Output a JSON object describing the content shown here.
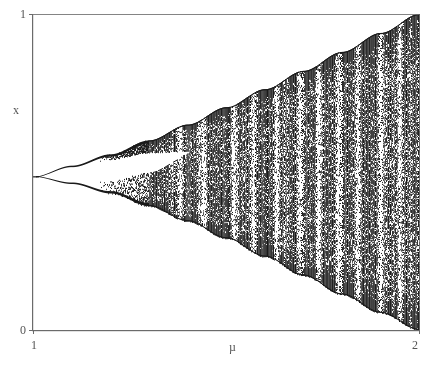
{
  "figure": {
    "background_color": "#ffffff",
    "ink_color": "#1a1a1a",
    "axis_color": "#6b6b6b",
    "label_color": "#555555"
  },
  "axes": {
    "y_axis_label": "x",
    "x_axis_label": "µ",
    "y_tick_top": "1",
    "y_tick_bottom": "0",
    "x_tick_left": "1",
    "x_tick_right": "2"
  },
  "chart_data": {
    "type": "scatter",
    "title": "",
    "subtitle": "",
    "xlabel": "µ",
    "ylabel": "x",
    "xlim": [
      1,
      2
    ],
    "ylim": [
      0,
      1
    ],
    "xticks": [
      1,
      2
    ],
    "xticklabels": [
      "1",
      "2"
    ],
    "yticks": [
      0,
      1
    ],
    "yticklabels": [
      "0",
      "1"
    ],
    "grid": false,
    "legend": null,
    "legend_position": "none",
    "plot_frame_px": {
      "left": 33,
      "right": 419,
      "top": 14,
      "bottom": 330
    },
    "features": {
      "bifurcation_origin": {
        "mu": 1.0,
        "x": 0.485
      },
      "upper_envelope": [
        {
          "mu": 1.0,
          "x": 0.485
        },
        {
          "mu": 1.1,
          "x": 0.52
        },
        {
          "mu": 1.2,
          "x": 0.556
        },
        {
          "mu": 1.3,
          "x": 0.6
        },
        {
          "mu": 1.4,
          "x": 0.65
        },
        {
          "mu": 1.5,
          "x": 0.705
        },
        {
          "mu": 1.6,
          "x": 0.762
        },
        {
          "mu": 1.7,
          "x": 0.82
        },
        {
          "mu": 1.8,
          "x": 0.88
        },
        {
          "mu": 1.9,
          "x": 0.94
        },
        {
          "mu": 2.0,
          "x": 1.0
        }
      ],
      "lower_envelope": [
        {
          "mu": 1.0,
          "x": 0.485
        },
        {
          "mu": 1.1,
          "x": 0.462
        },
        {
          "mu": 1.2,
          "x": 0.432
        },
        {
          "mu": 1.3,
          "x": 0.392
        },
        {
          "mu": 1.4,
          "x": 0.344
        },
        {
          "mu": 1.5,
          "x": 0.29
        },
        {
          "mu": 1.6,
          "x": 0.232
        },
        {
          "mu": 1.7,
          "x": 0.172
        },
        {
          "mu": 1.8,
          "x": 0.112
        },
        {
          "mu": 1.9,
          "x": 0.054
        },
        {
          "mu": 2.0,
          "x": 0.0
        }
      ],
      "period_two_gap": {
        "description": "White lens-shaped gap between the two period-2 branches, closing at onset of chaos.",
        "mu_start": 1.0,
        "mu_close": 1.42,
        "upper_edge": [
          {
            "mu": 1.0,
            "x": 0.485
          },
          {
            "mu": 1.1,
            "x": 0.512
          },
          {
            "mu": 1.2,
            "x": 0.54
          },
          {
            "mu": 1.3,
            "x": 0.562
          },
          {
            "mu": 1.42,
            "x": 0.565
          }
        ],
        "lower_edge": [
          {
            "mu": 1.0,
            "x": 0.485
          },
          {
            "mu": 1.1,
            "x": 0.47
          },
          {
            "mu": 1.2,
            "x": 0.472
          },
          {
            "mu": 1.3,
            "x": 0.5
          },
          {
            "mu": 1.42,
            "x": 0.565
          }
        ]
      },
      "chaos_onset_mu": 1.3,
      "periodic_windows_mu": [
        1.38,
        1.44,
        1.52,
        1.57,
        1.63,
        1.69,
        1.74,
        1.79,
        1.84,
        1.9,
        1.95
      ]
    }
  }
}
